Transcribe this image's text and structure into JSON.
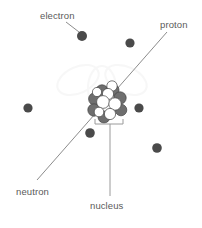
{
  "diagram": {
    "background_color": "#ffffff",
    "labels": {
      "electron": "electron",
      "proton": "proton",
      "neutron": "neutron",
      "nucleus": "nucleus"
    },
    "colors": {
      "text": "#5a5a5a",
      "leader_line": "#8c8c8c",
      "electron_fill": "#4a4a4a",
      "neutron_fill": "#6e6e6e",
      "proton_fill": "#ffffff",
      "particle_stroke": "#444444",
      "bracket": "#9a9a9a",
      "watermark": "#f2f2f2"
    },
    "electrons": [
      {
        "cx": 82,
        "cy": 36,
        "r": 5.0
      },
      {
        "cx": 130,
        "cy": 43,
        "r": 4.6
      },
      {
        "cx": 28,
        "cy": 108,
        "r": 4.6
      },
      {
        "cx": 139,
        "cy": 108,
        "r": 4.6
      },
      {
        "cx": 90,
        "cy": 133,
        "r": 4.8
      },
      {
        "cx": 157,
        "cy": 148,
        "r": 4.8
      }
    ],
    "nucleus_particles": [
      {
        "cx": 102,
        "cy": 91,
        "r": 6.2,
        "kind": "neutron"
      },
      {
        "cx": 113,
        "cy": 90,
        "r": 6.0,
        "kind": "neutron"
      },
      {
        "cx": 95,
        "cy": 99,
        "r": 6.4,
        "kind": "neutron"
      },
      {
        "cx": 120,
        "cy": 98,
        "r": 6.2,
        "kind": "neutron"
      },
      {
        "cx": 94,
        "cy": 110,
        "r": 6.2,
        "kind": "neutron"
      },
      {
        "cx": 121,
        "cy": 110,
        "r": 5.8,
        "kind": "neutron"
      },
      {
        "cx": 104,
        "cy": 117,
        "r": 6.0,
        "kind": "neutron"
      },
      {
        "cx": 112,
        "cy": 86,
        "r": 5.2,
        "kind": "proton"
      },
      {
        "cx": 103,
        "cy": 102,
        "r": 6.4,
        "kind": "proton"
      },
      {
        "cx": 115,
        "cy": 104,
        "r": 6.2,
        "kind": "proton"
      },
      {
        "cx": 108,
        "cy": 94,
        "r": 5.6,
        "kind": "proton"
      },
      {
        "cx": 97,
        "cy": 92,
        "r": 4.6,
        "kind": "proton"
      },
      {
        "cx": 110,
        "cy": 114,
        "r": 5.6,
        "kind": "proton"
      },
      {
        "cx": 99,
        "cy": 112,
        "r": 4.8,
        "kind": "proton"
      }
    ],
    "leaders": {
      "electron": {
        "x1": 66,
        "y1": 22,
        "x2": 79,
        "y2": 32
      },
      "proton_axis": {
        "x1": 167,
        "y1": 32,
        "x2": 37,
        "y2": 180
      },
      "nucleus_stem": {
        "x": 110,
        "y1": 128,
        "y2": 196
      }
    },
    "bracket": {
      "x1": 95,
      "x2": 123,
      "y": 124,
      "tick": 5
    }
  }
}
